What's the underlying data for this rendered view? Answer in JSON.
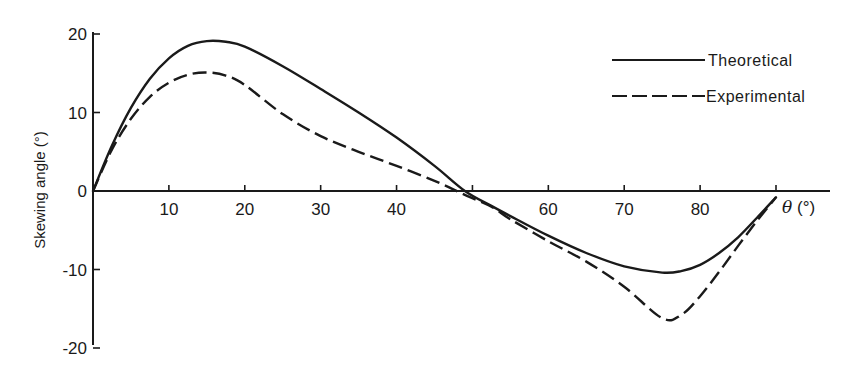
{
  "chart_data": {
    "type": "line",
    "title": "",
    "xlabel": "θ (°)",
    "ylabel": "Skewing angle (°)",
    "xlim": [
      0,
      90
    ],
    "ylim": [
      -20,
      20
    ],
    "x_ticks": [
      10,
      20,
      30,
      40,
      50,
      60,
      70,
      80,
      90
    ],
    "x_tick_labels": [
      "10",
      "20",
      "30",
      "40",
      "",
      "60",
      "70",
      "80",
      ""
    ],
    "y_ticks": [
      -20,
      -10,
      0,
      10,
      20
    ],
    "y_tick_labels": [
      "-20",
      "-10",
      "0",
      "10",
      "20"
    ],
    "grid": false,
    "legend_position": "upper right",
    "x": [
      0,
      2.5,
      5,
      7.5,
      10,
      12.5,
      15,
      17.5,
      20,
      25,
      30,
      35,
      40,
      45,
      49,
      52.5,
      55,
      60,
      65,
      70,
      75,
      77.5,
      80,
      82.5,
      85,
      87.5,
      90
    ],
    "series": [
      {
        "name": "Theoretical",
        "style": "solid",
        "values": [
          0,
          5.8,
          10.6,
          14.3,
          16.9,
          18.5,
          19.1,
          19.0,
          18.4,
          15.9,
          13.0,
          10.0,
          6.8,
          3.2,
          0,
          -1.9,
          -3.2,
          -5.7,
          -7.9,
          -9.6,
          -10.4,
          -10.2,
          -9.4,
          -7.9,
          -5.9,
          -3.4,
          -0.8
        ]
      },
      {
        "name": "Experimental",
        "style": "dashed",
        "values": [
          0,
          5.3,
          9.2,
          12.0,
          13.8,
          14.8,
          15.1,
          14.7,
          13.5,
          9.8,
          7.0,
          5.0,
          3.2,
          1.3,
          -0.5,
          -2.0,
          -3.6,
          -6.4,
          -9.0,
          -12.2,
          -16.2,
          -15.8,
          -13.4,
          -10.3,
          -7.0,
          -3.8,
          -0.8
        ]
      }
    ],
    "legend": [
      "Theoretical",
      "Experimental"
    ],
    "annotations": []
  },
  "axes": {
    "y_label": "Skewing angle (°)",
    "x_label_symbol": "θ",
    "x_label_unit": " (°)"
  },
  "legend": {
    "items": [
      {
        "label": "Theoretical",
        "style": "solid"
      },
      {
        "label": "Experimental",
        "style": "dashed"
      }
    ]
  },
  "colors": {
    "ink": "#1a1a1a",
    "background": "#ffffff"
  }
}
